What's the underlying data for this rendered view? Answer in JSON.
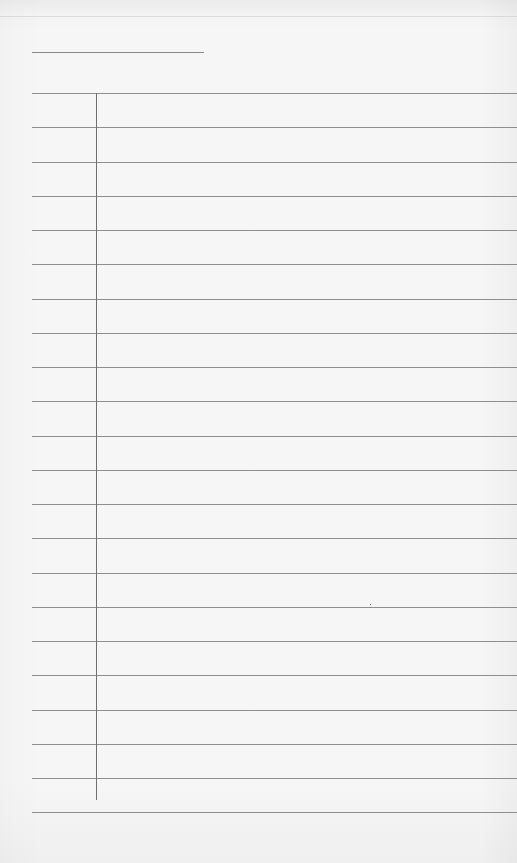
{
  "document": {
    "type": "lined-paper",
    "header": {
      "name_line_text": ""
    },
    "rules": {
      "count": 22,
      "first_y": 93,
      "spacing": 34.25,
      "color": "#8e8e8e"
    },
    "margin": {
      "x": 96,
      "color": "#6f6f6f"
    },
    "lines": [
      "",
      "",
      "",
      "",
      "",
      "",
      "",
      "",
      "",
      "",
      "",
      "",
      "",
      "",
      "",
      "",
      "",
      "",
      "",
      "",
      "",
      ""
    ],
    "background_color": "#fafafa"
  }
}
